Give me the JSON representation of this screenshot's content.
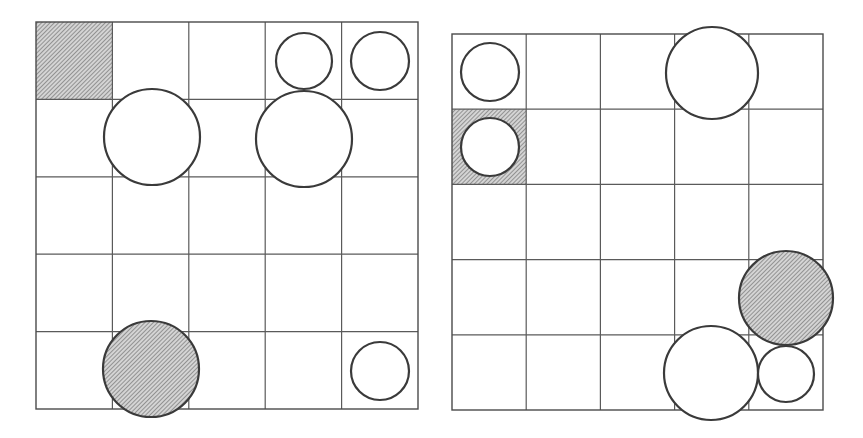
{
  "canvas": {
    "width": 863,
    "height": 438,
    "background": "#ffffff"
  },
  "colors": {
    "grid_line": "#5a5a5a",
    "circle_stroke": "#3a3a3a",
    "hatch_fill": "#d0d0d0",
    "hatch_line": "#6a6a6a"
  },
  "boards": [
    {
      "id": "left-board",
      "x": 36,
      "y": 22,
      "width": 382,
      "height": 387,
      "rows": 5,
      "cols": 5,
      "hatched_cells": [
        {
          "row": 0,
          "col": 0
        }
      ],
      "circles": [
        {
          "cx": 304,
          "cy": 61,
          "r": 28,
          "style": "open",
          "size": "small"
        },
        {
          "cx": 380,
          "cy": 61,
          "r": 29,
          "style": "open",
          "size": "small"
        },
        {
          "cx": 152,
          "cy": 137,
          "r": 48,
          "style": "open",
          "size": "large"
        },
        {
          "cx": 304,
          "cy": 139,
          "r": 48,
          "style": "open",
          "size": "large"
        },
        {
          "cx": 151,
          "cy": 369,
          "r": 48,
          "style": "hatched",
          "size": "large"
        },
        {
          "cx": 380,
          "cy": 371,
          "r": 29,
          "style": "open",
          "size": "small"
        }
      ]
    },
    {
      "id": "right-board",
      "x": 452,
      "y": 34,
      "width": 371,
      "height": 376,
      "rows": 5,
      "cols": 5,
      "hatched_cells": [
        {
          "row": 1,
          "col": 0
        }
      ],
      "circles": [
        {
          "cx": 490,
          "cy": 72,
          "r": 29,
          "style": "open",
          "size": "small"
        },
        {
          "cx": 490,
          "cy": 147,
          "r": 29,
          "style": "open",
          "size": "small"
        },
        {
          "cx": 712,
          "cy": 73,
          "r": 46,
          "style": "open",
          "size": "large"
        },
        {
          "cx": 786,
          "cy": 298,
          "r": 47,
          "style": "hatched",
          "size": "large"
        },
        {
          "cx": 711,
          "cy": 373,
          "r": 47,
          "style": "open",
          "size": "large"
        },
        {
          "cx": 786,
          "cy": 374,
          "r": 28,
          "style": "open",
          "size": "small"
        }
      ]
    }
  ]
}
